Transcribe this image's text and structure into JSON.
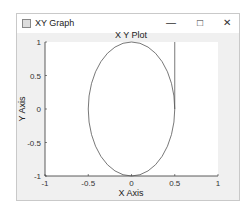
{
  "window": {
    "title": "XY Graph",
    "controls": {
      "minimize": "—",
      "maximize": "□",
      "close": "✕"
    }
  },
  "chart_data": {
    "type": "line",
    "title": "X Y Plot",
    "xlabel": "X Axis",
    "ylabel": "Y Axis",
    "xlim": [
      -1,
      1
    ],
    "ylim": [
      -1,
      1
    ],
    "xticks": [
      "-1",
      "-0.5",
      "0",
      "0.5",
      "1"
    ],
    "yticks": [
      "-1",
      "-0.5",
      "0",
      "0.5",
      "1"
    ],
    "grid": false,
    "series": [
      {
        "name": "ellipse",
        "shape": "ellipse",
        "center": [
          0,
          0
        ],
        "radius_x": 0.5,
        "radius_y": 1,
        "color": "#555555"
      },
      {
        "name": "vertical-line",
        "x": [
          0.5,
          0.5
        ],
        "y": [
          0,
          1
        ],
        "color": "#555555"
      }
    ]
  },
  "colors": {
    "figure_bg": "#f0f0f0",
    "axes_bg": "#ffffff",
    "line": "#555555"
  }
}
